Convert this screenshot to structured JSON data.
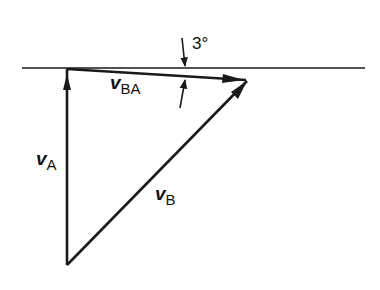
{
  "diagram": {
    "type": "velocity-vector-triangle",
    "reference_line": {
      "x1": 22,
      "y1": 68,
      "x2": 365,
      "y2": 68
    },
    "vertices": {
      "top_left": {
        "x": 67,
        "y": 68
      },
      "right": {
        "x": 248,
        "y": 80
      },
      "bottom": {
        "x": 67,
        "y": 265
      }
    },
    "vectors": [
      {
        "id": "vA",
        "symbol": "v",
        "subscript": "A",
        "from": "bottom",
        "to": "top_left"
      },
      {
        "id": "vBA",
        "symbol": "v",
        "subscript": "BA",
        "from": "top_left",
        "to": "right"
      },
      {
        "id": "vB",
        "symbol": "v",
        "subscript": "B",
        "from": "bottom",
        "to": "right"
      }
    ],
    "angle_annotation": {
      "value": "3°",
      "between": [
        "reference_line",
        "vBA"
      ]
    },
    "stroke_color": "#1a1a1a"
  },
  "labels": {
    "vA": {
      "symbol": "v",
      "sub": "A"
    },
    "vBA": {
      "symbol": "v",
      "sub": "BA"
    },
    "vB": {
      "symbol": "v",
      "sub": "B"
    },
    "angle": "3°"
  }
}
